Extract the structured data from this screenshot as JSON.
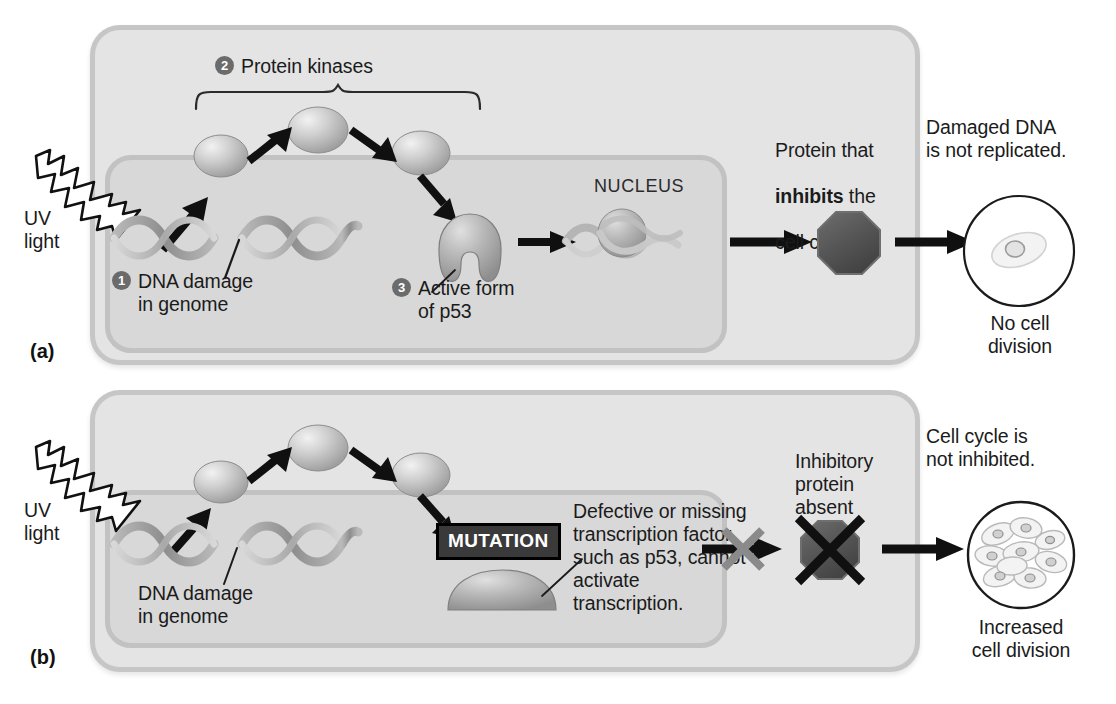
{
  "colors": {
    "cell_fill": "#e4e4e4",
    "cell_border": "#c6c6c6",
    "nucleus_fill": "#d8d8d8",
    "nucleus_border": "#c2c2c2",
    "protein_dark": "#5a5a5a",
    "arrow_black": "#101010",
    "x_gray": "#8a8a8a",
    "badge_gray": "#6b6b6b",
    "mutation_box": "#3a3a3a",
    "text": "#1b1b1b",
    "page_bg": "#ffffff"
  },
  "panel_a": {
    "letter": "(a)",
    "uv_label": "UV\nlight",
    "step2_num": "2",
    "step2_label": "Protein kinases",
    "step1_num": "1",
    "step1_label": "DNA damage\nin genome",
    "step3_num": "3",
    "step3_label": "Active form\nof p53",
    "nucleus_label": "NUCLEUS",
    "inhibitor_label_line1": "Protein that",
    "inhibitor_label_bold": "inhibits",
    "inhibitor_label_line1_tail": " the",
    "inhibitor_label_line2": "cell cycle",
    "outcome_label": "Damaged DNA\nis not replicated.",
    "outcome_caption": "No cell\ndivision"
  },
  "panel_b": {
    "letter": "(b)",
    "uv_label": "UV\nlight",
    "dna_label": "DNA damage\nin genome",
    "mutation_label": "MUTATION",
    "defective_label": "Defective or missing\ntranscription factor,\nsuch as p53, cannot\nactivate\ntranscription.",
    "absent_label": "Inhibitory\nprotein\nabsent",
    "outcome_label": "Cell cycle is\nnot inhibited.",
    "outcome_caption": "Increased\ncell division"
  },
  "icons": {
    "uv": "uv-lightning-bolt-icon",
    "dna": "dna-double-helix-icon",
    "kinase": "protein-kinase-oval-icon",
    "p53_active": "p53-active-horseshoe-icon",
    "p53_defective": "p53-defective-blob-icon",
    "chromatin": "chromatin-histone-icon",
    "inhibitor": "inhibitor-octagon-icon",
    "arrow": "arrow-right-icon",
    "brace": "curly-brace-icon",
    "cross": "cross-out-x-icon",
    "single_cell": "single-cell-icon",
    "many_cells": "proliferating-cells-icon"
  }
}
